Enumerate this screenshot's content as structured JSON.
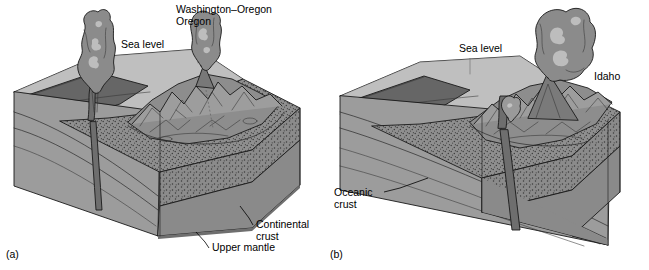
{
  "figure": {
    "type": "geologic-block-diagram-pair"
  },
  "panels": [
    {
      "id": "a",
      "caption": "(a)",
      "labels": {
        "sea_level": "Sea level",
        "volcano_region": "Washington–Oregon",
        "continental_crust": "Continental\ncrust",
        "continental_crust_line1": "Continental",
        "continental_crust_line2": "crust",
        "upper_mantle": "Upper mantle"
      }
    },
    {
      "id": "b",
      "caption": "(b)",
      "labels": {
        "sea_level": "Sea level",
        "volcano_region": "Idaho",
        "oceanic_crust_line1": "Oceanic",
        "oceanic_crust_line2": "crust"
      }
    }
  ],
  "colors": {
    "background": "#ffffff",
    "sea_water": "#c9c9c9",
    "sea_surface": "#bdbdbd",
    "ocean_floor": "#9a9a9a",
    "trench_dark": "#6f6f6f",
    "continental_crust_fill": "#8f8f8f",
    "continental_crust_stipple": "#3d3d3d",
    "upper_mantle": "#8a8a8a",
    "mantle_side": "#8e8e8e",
    "oceanic_slab": "#9f9f9f",
    "mountain_light": "#9d9d9d",
    "mountain_mid": "#8c8c8c",
    "mountain_dark": "#707070",
    "plume_body": "#8b8b8b",
    "plume_highlight": "#bcbcbc",
    "plume_dark": "#6a6a6a",
    "outline": "#1a1a1a",
    "text": "#000000"
  }
}
